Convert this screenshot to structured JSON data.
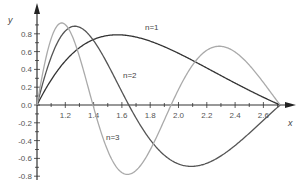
{
  "chart_data": {
    "type": "line",
    "title": "",
    "xlabel": "x",
    "ylabel": "y",
    "xlim": [
      1.0,
      2.75
    ],
    "ylim": [
      -0.8,
      1.0
    ],
    "grid": false,
    "legend": "inline labels",
    "x_ticks": [
      "1.2",
      "1.4",
      "1.6",
      "1.8",
      "2.0",
      "2.2",
      "2.4",
      "2.6"
    ],
    "y_ticks": [
      "0.8",
      "0.6",
      "0.4",
      "0.2",
      "0.0",
      "-0.2",
      "-0.4",
      "-0.6",
      "-0.8"
    ],
    "series": [
      {
        "name": "n=1",
        "color": "#333333",
        "x": [
          1.0,
          1.2,
          1.4,
          1.6,
          1.649,
          1.8,
          2.0,
          2.2,
          2.4,
          2.6,
          2.718
        ],
        "y": [
          0.0,
          0.49,
          0.72,
          0.79,
          0.78,
          0.75,
          0.63,
          0.47,
          0.3,
          0.11,
          0.0
        ]
      },
      {
        "name": "n=2",
        "color": "#555555",
        "x": [
          1.0,
          1.1,
          1.2,
          1.284,
          1.4,
          1.6,
          1.649,
          1.8,
          2.0,
          2.117,
          2.2,
          2.4,
          2.6,
          2.718
        ],
        "y": [
          0.0,
          0.53,
          0.81,
          0.88,
          0.81,
          0.25,
          0.0,
          -0.35,
          -0.66,
          -0.69,
          -0.67,
          -0.48,
          -0.18,
          0.0
        ]
      },
      {
        "name": "n=3",
        "color": "#aaaaaa",
        "x": [
          1.0,
          1.1,
          1.181,
          1.3,
          1.396,
          1.5,
          1.649,
          1.8,
          1.948,
          2.1,
          2.3,
          2.5,
          2.718
        ],
        "y": [
          0.0,
          0.75,
          0.92,
          0.6,
          0.0,
          -0.53,
          -0.78,
          -0.5,
          0.0,
          0.48,
          0.66,
          0.46,
          0.0
        ]
      }
    ],
    "annotations": [
      {
        "text": "n=1",
        "x": 1.78,
        "y": 0.86
      },
      {
        "text": "n=2",
        "x": 1.62,
        "y": 0.32
      },
      {
        "text": "n=3",
        "x": 1.49,
        "y": -0.37
      }
    ],
    "function_note": "y = sin(n·π·ln x)/√x"
  },
  "labels": {
    "x_axis": "x",
    "y_axis": "y",
    "n1": "n=1",
    "n2": "n=2",
    "n3": "n=3"
  }
}
